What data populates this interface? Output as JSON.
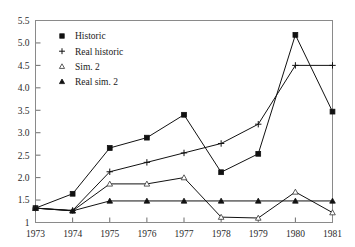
{
  "chart_data": {
    "type": "line",
    "title": "",
    "subtitle": "",
    "xlabel": "",
    "ylabel": "",
    "categories": [
      "1973",
      "1974",
      "1975",
      "1976",
      "1977",
      "1978",
      "1979",
      "1980",
      "1981"
    ],
    "x": [
      1973,
      1974,
      1975,
      1976,
      1977,
      1978,
      1979,
      1980,
      1981
    ],
    "xlim": [
      1973,
      1981
    ],
    "ylim": [
      1.0,
      5.5
    ],
    "yticks": [
      1.0,
      1.5,
      2.0,
      2.5,
      3.0,
      3.5,
      4.0,
      4.5,
      5.0,
      5.5
    ],
    "ytick_labels": [
      "1",
      "1.5",
      "2.0",
      "2.5",
      "3.0",
      "3.5",
      "4.0",
      "4.5",
      "5.0",
      "5.5"
    ],
    "grid": false,
    "legend_position": "top-left",
    "series": [
      {
        "name": "Historic",
        "marker": "filled-square",
        "values": [
          1.32,
          1.64,
          2.66,
          2.89,
          3.4,
          2.12,
          2.53,
          5.18,
          3.47
        ]
      },
      {
        "name": "Real historic",
        "marker": "plus",
        "values": [
          1.32,
          1.27,
          2.13,
          2.34,
          2.55,
          2.76,
          3.19,
          4.5,
          4.5
        ]
      },
      {
        "name": "Sim. 2",
        "marker": "open-triangle",
        "values": [
          1.32,
          1.26,
          1.86,
          1.86,
          2.0,
          1.12,
          1.1,
          1.68,
          1.22
        ]
      },
      {
        "name": "Real sim. 2",
        "marker": "filled-triangle",
        "values": [
          1.32,
          1.26,
          1.48,
          1.48,
          1.48,
          1.48,
          1.48,
          1.48,
          1.48
        ]
      }
    ]
  },
  "legend": {
    "items": [
      {
        "label": "Historic",
        "marker": "filled-square"
      },
      {
        "label": "Real historic",
        "marker": "plus"
      },
      {
        "label": "Sim. 2",
        "marker": "open-triangle"
      },
      {
        "label": "Real sim. 2",
        "marker": "filled-triangle"
      }
    ]
  },
  "colors": {
    "line": "#111111",
    "frame": "#8a8a8a",
    "text": "#2b2b2b",
    "background": "#ffffff"
  }
}
